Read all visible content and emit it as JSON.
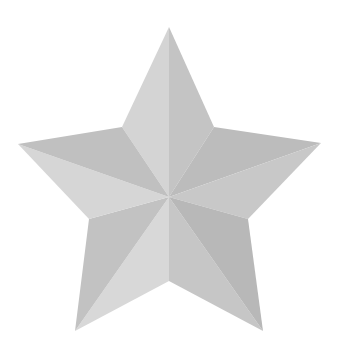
{
  "image": {
    "subject": "faceted five-pointed star",
    "icon": "star-icon",
    "background": "#ffffff",
    "center": [
      169,
      197
    ],
    "outer_points": {
      "top": [
        169,
        27
      ],
      "right": [
        321,
        143
      ],
      "bottom_right": [
        263,
        331
      ],
      "bottom_left": [
        75,
        331
      ],
      "left": [
        18,
        144
      ]
    },
    "inner_points": {
      "upper_right": [
        214,
        127
      ],
      "lower_right": [
        248,
        219
      ],
      "bottom": [
        169,
        281
      ],
      "lower_left": [
        89,
        219
      ],
      "upper_left": [
        122,
        127
      ]
    },
    "facet_colors": {
      "top_left": "#d4d4d4",
      "top_right": "#c4c4c4",
      "right_top": "#bcbcbc",
      "right_bottom": "#c8c8c8",
      "bottom_right_inner": "#c6c6c6",
      "bottom_right_outer": "#b8b8b8",
      "bottom_left_inner": "#d8d8d8",
      "bottom_left_outer": "#c2c2c2",
      "left_bottom": "#d6d6d6",
      "left_top": "#c0c0c0"
    }
  }
}
